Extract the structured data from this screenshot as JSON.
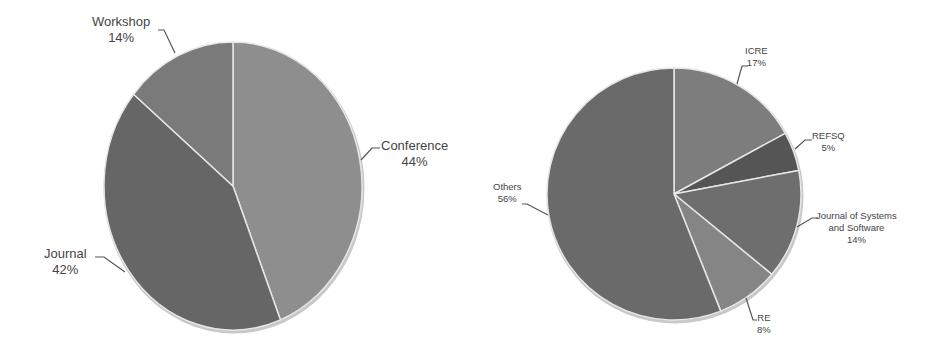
{
  "chart_data": [
    {
      "type": "pie",
      "title": "",
      "categories": [
        "Conference",
        "Journal",
        "Workshop"
      ],
      "values": [
        44,
        42,
        14
      ],
      "unit": "%",
      "colors": [
        "#8e8e8e",
        "#666666",
        "#7a7a7a"
      ],
      "start_angle": "12 o'clock, clockwise",
      "labels": [
        {
          "name": "Conference",
          "pct": "44%"
        },
        {
          "name": "Journal",
          "pct": "42%"
        },
        {
          "name": "Workshop",
          "pct": "14%"
        }
      ],
      "legend": "none (data labels with leader lines)"
    },
    {
      "type": "pie",
      "title": "",
      "categories": [
        "ICRE",
        "REFSQ",
        "Journal of Systems and Software",
        "RE",
        "Others"
      ],
      "values": [
        17,
        5,
        14,
        8,
        56
      ],
      "unit": "%",
      "colors": [
        "#7d7d7d",
        "#555555",
        "#6e6e6e",
        "#858585",
        "#6a6a6a"
      ],
      "start_angle": "12 o'clock, clockwise",
      "labels": [
        {
          "name": "ICRE",
          "pct": "17%"
        },
        {
          "name": "REFSQ",
          "pct": "5%"
        },
        {
          "name_line1": "Journal of Systems",
          "name_line2": "and Software",
          "pct": "14%"
        },
        {
          "name": "RE",
          "pct": "8%"
        },
        {
          "name": "Others",
          "pct": "56%"
        }
      ],
      "legend": "none (data labels with leader lines)"
    }
  ]
}
